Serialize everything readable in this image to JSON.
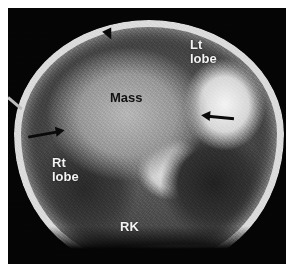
{
  "figure": {
    "labels": {
      "left_lobe_line1": "Lt",
      "left_lobe_line2": "lobe",
      "mass": "Mass",
      "right_lobe_line1": "Rt",
      "right_lobe_line2": "lobe",
      "right_kidney": "RK"
    },
    "annotations": [
      {
        "type": "arrowhead",
        "direction": "down",
        "position": "top rim of mass"
      },
      {
        "type": "arrow",
        "direction": "right",
        "position": "left margin of mass"
      },
      {
        "type": "arrow",
        "direction": "left",
        "position": "right margin of mass"
      }
    ]
  }
}
